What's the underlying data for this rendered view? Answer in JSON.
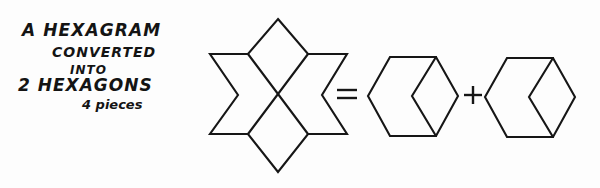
{
  "page": {
    "background_color": "#fdfdfd",
    "ink_color": "#161616",
    "width": 600,
    "height": 188
  },
  "caption": {
    "line1": "A HEXAGRAM",
    "line2": "CONVERTED",
    "line3": "INTO",
    "line4": "2 HEXAGONS",
    "line5": "4 pieces"
  },
  "equation": {
    "equals_sign": "=",
    "plus_sign": "+"
  },
  "figures": {
    "hexagram": {
      "label": "hexagram",
      "points": 6,
      "piece_count": 4,
      "outline": "278,19 308,54 347,54 322,95 347,134 308,134 278,172 248,134 210,134 238,95 210,54 248,54",
      "cut_line_1": "248,54 308,134",
      "cut_line_2": "308,54 248,134"
    },
    "hexagon_left": {
      "label": "hexagon",
      "piece_count": 2,
      "outline": "390,57 436,57 458,96 436,136 390,136 368,96",
      "cut_line": "436,57 412,96 436,136"
    },
    "hexagon_right": {
      "label": "hexagon",
      "piece_count": 2,
      "outline": "507,58 553,58 575,97 553,137 507,137 485,97",
      "cut_line": "553,58 529,97 553,137"
    }
  }
}
